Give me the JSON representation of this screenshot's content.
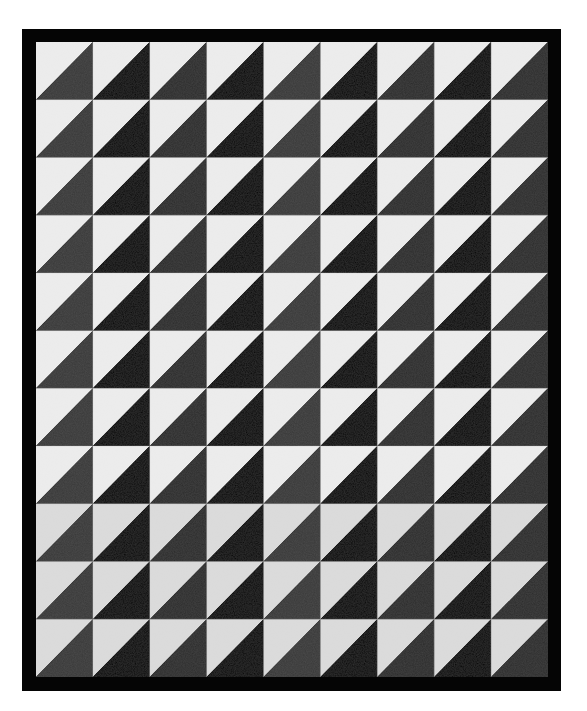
{
  "image": {
    "subject": "Half-square triangle quilt",
    "description": "Black-bordered quilt made of white and black/dark-gray half-square triangles, light triangle top-left, dark triangle bottom-right in each block",
    "width": 587,
    "height": 711
  },
  "quilt": {
    "frame": {
      "x": 22,
      "y": 29,
      "width": 539,
      "height": 662,
      "color": "#050505"
    },
    "inner": {
      "x": 36,
      "y": 42,
      "width": 512,
      "height": 635
    },
    "columns": 9,
    "rows": 11,
    "colors": {
      "light": "#ededed",
      "light_lower": "#dcdcdc",
      "dark_black": "#060606",
      "dark_gray": "#2e2e2e",
      "dark_gray_faded": "#3a3a3a",
      "seam": "#bdbdbd",
      "background": "#ffffff"
    },
    "column_dark_tone": [
      "gray",
      "black",
      "gray",
      "black",
      "gray",
      "black",
      "gray",
      "black",
      "gray"
    ]
  }
}
